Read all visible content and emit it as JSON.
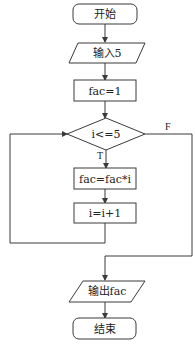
{
  "flowchart": {
    "nodes": {
      "start": {
        "label": "开始",
        "shape": "rounded-rect"
      },
      "input": {
        "label": "输入5",
        "shape": "parallelogram"
      },
      "init": {
        "label": "fac=1",
        "shape": "rect"
      },
      "condition": {
        "label": "i<=5",
        "shape": "diamond"
      },
      "multiply": {
        "label": "fac=fac*i",
        "shape": "rect"
      },
      "increment": {
        "label": "i=i+1",
        "shape": "rect"
      },
      "output": {
        "label": "输出fac",
        "shape": "parallelogram"
      },
      "end": {
        "label": "结束",
        "shape": "rounded-rect"
      }
    },
    "edge_labels": {
      "true": "T",
      "false": "F"
    }
  }
}
